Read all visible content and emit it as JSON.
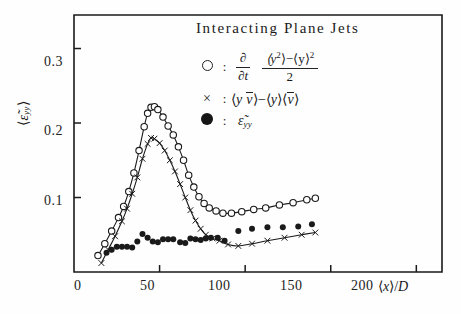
{
  "figure": {
    "title": "Interacting Plane Jets",
    "background_color": "#fefefe",
    "ink_color": "#1a1a1a"
  },
  "axes": {
    "y_label_parts": {
      "open": "⟨",
      "eps": "ε̃",
      "sub": "yy",
      "close": "⟩"
    },
    "x_label_parts": {
      "open": "⟨",
      "var": "x",
      "close": "⟩",
      "slash": "/",
      "denom": "D"
    },
    "y_ticks": [
      "0.3",
      "0.2",
      "0.1"
    ],
    "y_tick_values": [
      0.3,
      0.2,
      0.1
    ],
    "x_ticks": [
      "0",
      "50",
      "100",
      "150",
      "200"
    ],
    "x_tick_values": [
      0,
      50,
      100,
      150,
      200
    ],
    "xlim": [
      0,
      215
    ],
    "ylim": [
      0,
      0.345
    ],
    "grid": false
  },
  "legend": {
    "position": "inside-top-right",
    "entries": [
      {
        "marker": "open-circle",
        "colon": ":",
        "operator_num": "∂",
        "operator_den": "∂t",
        "frac_num_a": "⟨y",
        "frac_num_a_sup": "2",
        "frac_num_mid": "⟩−⟨y⟩",
        "frac_num_sup": "2",
        "frac_den": "2"
      },
      {
        "marker": "cross",
        "colon": ":",
        "text_open": "⟨",
        "text_y": "y",
        "text_vbar": "v",
        "text_mid": "⟩−⟨",
        "text_y2": "y",
        "text_mid2": "⟩⟨",
        "text_vbar2": "v",
        "text_close": "⟩"
      },
      {
        "marker": "filled-circle",
        "colon": ":",
        "eps": "ε̃",
        "sub": "yy"
      }
    ]
  },
  "chart_data": {
    "type": "scatter",
    "title": "Interacting Plane Jets",
    "xlabel": "⟨x⟩/D",
    "ylabel": "⟨ε̃yy⟩",
    "xlim": [
      0,
      215
    ],
    "ylim": [
      0,
      0.345
    ],
    "grid": false,
    "legend_position": "inside-top-right",
    "series": [
      {
        "name": "∂/∂t (⟨y²⟩−⟨y⟩²)/2",
        "marker": "open-circle",
        "has_fit_line": true,
        "points": [
          {
            "x": 14,
            "y": 0.022
          },
          {
            "x": 18,
            "y": 0.038
          },
          {
            "x": 22,
            "y": 0.055
          },
          {
            "x": 26,
            "y": 0.073
          },
          {
            "x": 29,
            "y": 0.088
          },
          {
            "x": 32,
            "y": 0.108
          },
          {
            "x": 35,
            "y": 0.133
          },
          {
            "x": 38,
            "y": 0.163
          },
          {
            "x": 41,
            "y": 0.195
          },
          {
            "x": 43,
            "y": 0.213
          },
          {
            "x": 45,
            "y": 0.221
          },
          {
            "x": 47,
            "y": 0.222
          },
          {
            "x": 49,
            "y": 0.218
          },
          {
            "x": 52,
            "y": 0.208
          },
          {
            "x": 55,
            "y": 0.196
          },
          {
            "x": 58,
            "y": 0.184
          },
          {
            "x": 61,
            "y": 0.168
          },
          {
            "x": 64,
            "y": 0.15
          },
          {
            "x": 67,
            "y": 0.13
          },
          {
            "x": 70,
            "y": 0.114
          },
          {
            "x": 73,
            "y": 0.101
          },
          {
            "x": 76,
            "y": 0.092
          },
          {
            "x": 79,
            "y": 0.086
          },
          {
            "x": 83,
            "y": 0.082
          },
          {
            "x": 87,
            "y": 0.079
          },
          {
            "x": 92,
            "y": 0.079
          },
          {
            "x": 98,
            "y": 0.081
          },
          {
            "x": 105,
            "y": 0.084
          },
          {
            "x": 112,
            "y": 0.086
          },
          {
            "x": 120,
            "y": 0.09
          },
          {
            "x": 128,
            "y": 0.093
          },
          {
            "x": 136,
            "y": 0.097
          },
          {
            "x": 141,
            "y": 0.099
          }
        ]
      },
      {
        "name": "⟨y v̄⟩−⟨y⟩⟨v̄⟩",
        "marker": "cross",
        "has_fit_line": true,
        "points": [
          {
            "x": 16,
            "y": 0.012
          },
          {
            "x": 20,
            "y": 0.03
          },
          {
            "x": 24,
            "y": 0.048
          },
          {
            "x": 28,
            "y": 0.068
          },
          {
            "x": 31,
            "y": 0.085
          },
          {
            "x": 34,
            "y": 0.105
          },
          {
            "x": 37,
            "y": 0.127
          },
          {
            "x": 40,
            "y": 0.152
          },
          {
            "x": 43,
            "y": 0.172
          },
          {
            "x": 45,
            "y": 0.18
          },
          {
            "x": 47,
            "y": 0.179
          },
          {
            "x": 50,
            "y": 0.173
          },
          {
            "x": 53,
            "y": 0.163
          },
          {
            "x": 56,
            "y": 0.15
          },
          {
            "x": 59,
            "y": 0.135
          },
          {
            "x": 62,
            "y": 0.118
          },
          {
            "x": 65,
            "y": 0.1
          },
          {
            "x": 68,
            "y": 0.083
          },
          {
            "x": 71,
            "y": 0.069
          },
          {
            "x": 74,
            "y": 0.058
          },
          {
            "x": 77,
            "y": 0.05
          },
          {
            "x": 81,
            "y": 0.045
          },
          {
            "x": 85,
            "y": 0.042
          },
          {
            "x": 90,
            "y": 0.037
          },
          {
            "x": 96,
            "y": 0.035
          },
          {
            "x": 104,
            "y": 0.038
          },
          {
            "x": 113,
            "y": 0.042
          },
          {
            "x": 123,
            "y": 0.046
          },
          {
            "x": 133,
            "y": 0.05
          },
          {
            "x": 141,
            "y": 0.053
          }
        ]
      },
      {
        "name": "ε̃yy",
        "marker": "filled-circle",
        "has_fit_line": false,
        "points": [
          {
            "x": 19,
            "y": 0.026
          },
          {
            "x": 22,
            "y": 0.03
          },
          {
            "x": 25,
            "y": 0.034
          },
          {
            "x": 28,
            "y": 0.034
          },
          {
            "x": 31,
            "y": 0.034
          },
          {
            "x": 34,
            "y": 0.033
          },
          {
            "x": 37,
            "y": 0.041
          },
          {
            "x": 40,
            "y": 0.051
          },
          {
            "x": 43,
            "y": 0.046
          },
          {
            "x": 46,
            "y": 0.041
          },
          {
            "x": 49,
            "y": 0.04
          },
          {
            "x": 52,
            "y": 0.044
          },
          {
            "x": 55,
            "y": 0.044
          },
          {
            "x": 58,
            "y": 0.044
          },
          {
            "x": 62,
            "y": 0.04
          },
          {
            "x": 65,
            "y": 0.039
          },
          {
            "x": 68,
            "y": 0.045
          },
          {
            "x": 71,
            "y": 0.044
          },
          {
            "x": 74,
            "y": 0.043
          },
          {
            "x": 77,
            "y": 0.045
          },
          {
            "x": 80,
            "y": 0.046
          },
          {
            "x": 84,
            "y": 0.046
          },
          {
            "x": 88,
            "y": 0.042
          },
          {
            "x": 96,
            "y": 0.055
          },
          {
            "x": 104,
            "y": 0.058
          },
          {
            "x": 113,
            "y": 0.06
          },
          {
            "x": 122,
            "y": 0.06
          },
          {
            "x": 131,
            "y": 0.061
          },
          {
            "x": 139,
            "y": 0.064
          }
        ]
      }
    ]
  }
}
